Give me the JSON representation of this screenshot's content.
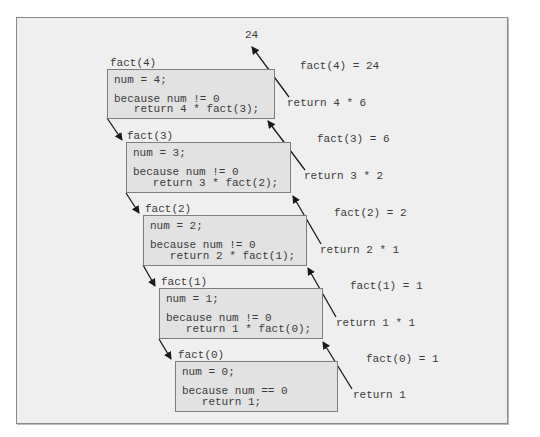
{
  "result_top": "24",
  "frames": [
    {
      "label": "fact(4)",
      "line1": "num = 4;",
      "line2": "because num != 0",
      "line3": "   return 4 * fact(3);"
    },
    {
      "label": "fact(3)",
      "line1": "num = 3;",
      "line2": "because num != 0",
      "line3": "   return 3 * fact(2);"
    },
    {
      "label": "fact(2)",
      "line1": "num = 2;",
      "line2": "because num != 0",
      "line3": "   return 2 * fact(1);"
    },
    {
      "label": "fact(1)",
      "line1": "num = 1;",
      "line2": "because num != 0",
      "line3": "   return 1 * fact(0);"
    },
    {
      "label": "fact(0)",
      "line1": "num = 0;",
      "line2": "because num == 0",
      "line3": "   return 1;"
    }
  ],
  "returns": [
    {
      "value_label": "fact(4) = 24",
      "return_label": "return 4 * 6"
    },
    {
      "value_label": "fact(3) = 6",
      "return_label": "return 3 * 2"
    },
    {
      "value_label": "fact(2) = 2",
      "return_label": "return 2 * 1"
    },
    {
      "value_label": "fact(1) = 1",
      "return_label": "return 1 * 1"
    },
    {
      "value_label": "fact(0) = 1",
      "return_label": "return 1"
    }
  ]
}
